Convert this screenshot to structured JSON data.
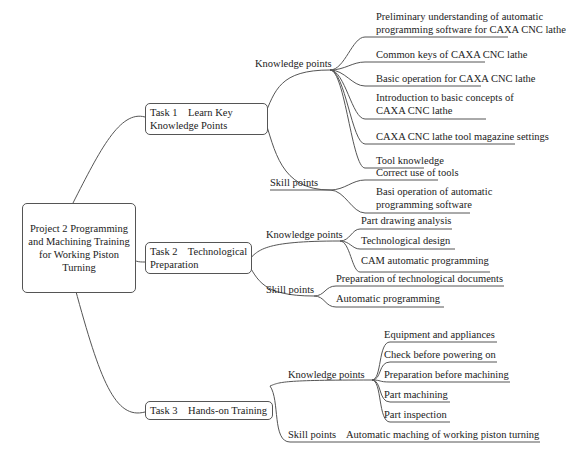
{
  "root": {
    "label": "Project 2 Programming and Machining Training for Working Piston Turning"
  },
  "tasks": [
    {
      "label_line1": "Task 1    Learn Key",
      "label_line2": "Knowledge Points",
      "knowledge_label": "Knowledge points",
      "knowledge": [
        {
          "line1": "Preliminary understanding of automatic",
          "line2": "programming software for CAXA CNC lathe"
        },
        {
          "line1": "Common keys of CAXA CNC lathe"
        },
        {
          "line1": "Basic operation for CAXA CNC lathe"
        },
        {
          "line1": "Introduction to basic concepts of",
          "line2": "CAXA CNC lathe"
        },
        {
          "line1": "CAXA CNC lathe tool magazine settings"
        },
        {
          "line1": "Tool knowledge"
        }
      ],
      "skill_label": "Skill points",
      "skills": [
        {
          "line1": "Correct use of tools"
        },
        {
          "line1": "Basi operation of automatic",
          "line2": "programming software"
        }
      ]
    },
    {
      "label_line1": "Task 2    Technological",
      "label_line2": "Preparation",
      "knowledge_label": "Knowledge points",
      "knowledge": [
        {
          "line1": "Part drawing analysis"
        },
        {
          "line1": "Technological design"
        },
        {
          "line1": "CAM automatic programming"
        }
      ],
      "skill_label": "Skill points",
      "skills": [
        {
          "line1": "Preparation of technological documents"
        },
        {
          "line1": "Automatic programming"
        }
      ]
    },
    {
      "label_line1": "Task 3    Hands-on Training",
      "knowledge_label": "Knowledge points",
      "knowledge": [
        {
          "line1": "Equipment and appliances"
        },
        {
          "line1": "Check before powering on"
        },
        {
          "line1": "Preparation before machining"
        },
        {
          "line1": "Part machining"
        },
        {
          "line1": "Part inspection"
        }
      ],
      "skill_label": "Skill points",
      "skills": [
        {
          "line1": "Automatic maching of working piston turning"
        }
      ]
    }
  ]
}
